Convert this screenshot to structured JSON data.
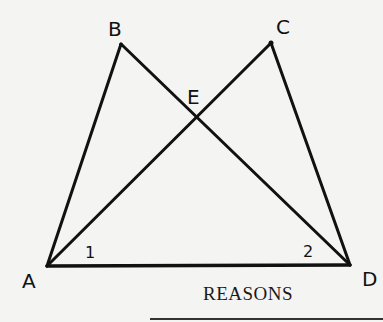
{
  "diagram": {
    "points": {
      "A": {
        "label": "A",
        "x": 47,
        "y": 266
      },
      "B": {
        "label": "B",
        "x": 121,
        "y": 44
      },
      "C": {
        "label": "C",
        "x": 271,
        "y": 43
      },
      "D": {
        "label": "D",
        "x": 350,
        "y": 265
      },
      "E": {
        "label": "E",
        "x": 197,
        "y": 117
      }
    },
    "segments": [
      "AB",
      "AC",
      "BD",
      "CD",
      "AD"
    ],
    "angles": [
      {
        "label": "1",
        "vertex": "A"
      },
      {
        "label": "2",
        "vertex": "D"
      }
    ],
    "stroke_color": "#111111"
  },
  "footer": {
    "heading": "REASONS"
  }
}
